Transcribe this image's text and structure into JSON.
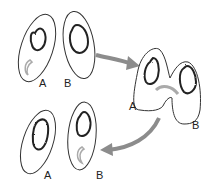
{
  "diagram": {
    "stage1": {
      "cell_a_label": "A",
      "cell_b_label": "B"
    },
    "stage2": {
      "cell_a_label": "A",
      "cell_b_label": "B"
    },
    "stage3": {
      "cell_a_label": "A",
      "cell_b_label": "B"
    },
    "colors": {
      "outline": "#333333",
      "nucleus": "#222222",
      "arrow": "#8c8c8c",
      "plasmid": "#aaaaaa"
    }
  }
}
